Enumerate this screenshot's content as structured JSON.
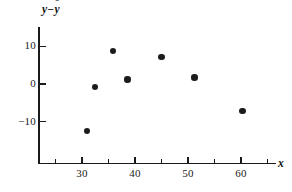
{
  "chart_data": {
    "type": "scatter",
    "title": "",
    "xlabel": "x",
    "ylabel": "y − ŷ",
    "ylabel_parts": {
      "base": "y",
      "minus": "−",
      "hatbase": "y",
      "hat": "ˆ"
    },
    "xlim": [
      22,
      67
    ],
    "ylim": [
      -20,
      15
    ],
    "grid": false,
    "legend": null,
    "x": [
      31,
      32.5,
      35.8,
      38.6,
      45.0,
      51.2,
      60.3
    ],
    "y": [
      -12.5,
      -0.8,
      8.7,
      1.2,
      7.2,
      1.7,
      -7.2
    ],
    "points": [
      {
        "x": 31.0,
        "y": -12.5
      },
      {
        "x": 32.5,
        "y": -0.8
      },
      {
        "x": 35.8,
        "y": 8.7
      },
      {
        "x": 38.6,
        "y": 1.2
      },
      {
        "x": 45.0,
        "y": 7.2
      },
      {
        "x": 51.2,
        "y": 1.7
      },
      {
        "x": 60.3,
        "y": -7.2
      }
    ],
    "xticks": [
      30,
      40,
      50,
      60
    ],
    "xtick_labels": [
      "30",
      "40",
      "50",
      "60"
    ],
    "xticks_minor": [
      25,
      35,
      45,
      55,
      65
    ],
    "yticks": [
      10,
      0,
      -10
    ],
    "ytick_labels": [
      "10",
      "0",
      "−10"
    ],
    "marker": "filled-circle",
    "marker_color": "#1c1c1c",
    "axis_color": "#1a1a1a"
  },
  "axes": {
    "x_axis_name": "x-axis",
    "y_axis_name": "y-axis"
  }
}
